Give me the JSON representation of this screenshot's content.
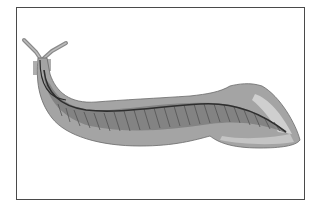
{
  "figure": {
    "alt": "Side-view illustration of an elongated, eel-like primitive chordate with two tentacles on the head, a notochord running along the body, segmented muscle blocks, and a broad tail fin",
    "colors": {
      "frame_border": "#4a4a4a",
      "background": "#ffffff",
      "body_outer": "#9a9a9a",
      "body_inner": "#7c7c7c",
      "fin_light": "#c8c8c8",
      "notochord": "#3a3a3a",
      "myomeres": "#5a5a5a"
    }
  }
}
